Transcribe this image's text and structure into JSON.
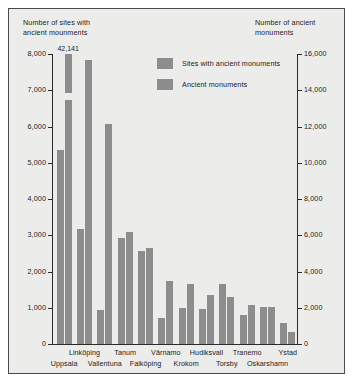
{
  "chart_data": {
    "type": "bar",
    "title": "",
    "left_axis_title": "Number of sites with\nancient mounments",
    "right_axis_title": "Number of ancient\nmonuments",
    "categories": [
      "Uppsala",
      "Linköping",
      "Vallentuna",
      "Tanum",
      "Falköping",
      "Värnamo",
      "Krokom",
      "Hudiksvall",
      "Torsby",
      "Tranemo",
      "Oskarshamn",
      "Ystad"
    ],
    "series": [
      {
        "name": "Sites with ancient monuments",
        "axis": "left",
        "values": [
          5350,
          3180,
          930,
          2930,
          2560,
          710,
          980,
          960,
          1660,
          790,
          1020,
          580
        ]
      },
      {
        "name": "Ancient monuments",
        "axis": "right",
        "values": [
          42141,
          15650,
          12150,
          6190,
          5300,
          3470,
          3310,
          2690,
          2620,
          2180,
          2020,
          660
        ]
      }
    ],
    "left_ticks": [
      "0",
      "1,000",
      "2,000",
      "3,000",
      "4,000",
      "5,000",
      "6,000",
      "7,000",
      "8,000"
    ],
    "right_ticks": [
      "0",
      "2,000",
      "4,000",
      "6,000",
      "8,000",
      "10,000",
      "12,000",
      "14,000",
      "16,000"
    ],
    "left_ylim": [
      0,
      8000
    ],
    "right_ylim": [
      0,
      16000
    ],
    "grid": false,
    "legend_position": "top-center",
    "annotations": [
      {
        "text": "42,141",
        "category": "Uppsala",
        "series": "Ancient monuments",
        "note": "bar is broken / truncated at axis top"
      }
    ],
    "colors": {
      "bar": "#8d8d8d",
      "background": "#ececeb",
      "axis": "#2a2a2a",
      "text": "#1d1d1d"
    }
  }
}
